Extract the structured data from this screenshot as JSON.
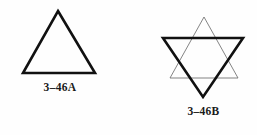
{
  "page": {
    "background_color": "#fefefe",
    "width": 257,
    "height": 135,
    "ink_color_bold": "#111111",
    "ink_color_thin": "#6e6e6e"
  },
  "figures": [
    {
      "id": "figure-a",
      "name": "equilateral-triangle",
      "caption": "3–46A",
      "shapes": [
        {
          "name": "bold-upward-triangle",
          "weight": "bold",
          "points": "58,11 95,73 23,73"
        }
      ]
    },
    {
      "id": "figure-b",
      "name": "star-of-david",
      "caption": "3–46B",
      "shapes": [
        {
          "name": "thin-upward-triangle",
          "weight": "thin",
          "points": "54,17 88,78 20,78"
        },
        {
          "name": "bold-downward-triangle",
          "weight": "bold",
          "points": "13,38 93,38 53,97"
        }
      ]
    }
  ]
}
